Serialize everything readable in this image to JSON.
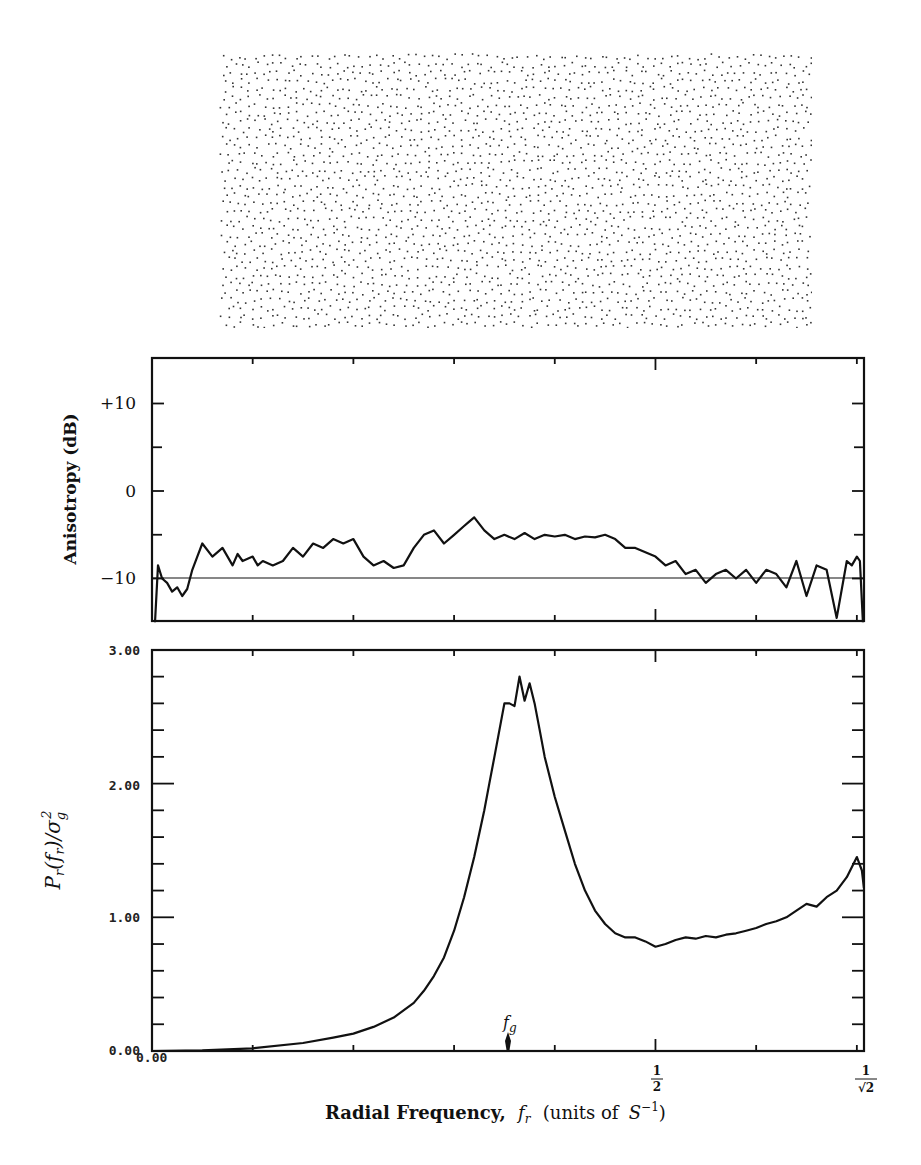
{
  "figure": {
    "stipple_pattern": {
      "description": "blue-noise dot pattern",
      "rows": 34,
      "cols": 74,
      "dot_color": "#333333"
    }
  },
  "chart_data": [
    {
      "type": "line",
      "title": "",
      "ylabel": "Anisotropy (dB)",
      "xlabel": "",
      "ylim": [
        -15,
        15
      ],
      "xlim": [
        0,
        0.7071
      ],
      "yticks": [
        {
          "value": 10,
          "label": "+10"
        },
        {
          "value": 0,
          "label": "0"
        },
        {
          "value": -10,
          "label": "-10"
        }
      ],
      "reference_line": {
        "y": -10
      },
      "grid": false,
      "series": [
        {
          "name": "Anisotropy",
          "x": [
            0.003,
            0.006,
            0.01,
            0.015,
            0.02,
            0.025,
            0.03,
            0.035,
            0.04,
            0.045,
            0.05,
            0.06,
            0.07,
            0.08,
            0.085,
            0.09,
            0.1,
            0.105,
            0.11,
            0.12,
            0.13,
            0.14,
            0.15,
            0.16,
            0.17,
            0.18,
            0.19,
            0.2,
            0.21,
            0.22,
            0.23,
            0.24,
            0.25,
            0.26,
            0.27,
            0.28,
            0.29,
            0.3,
            0.31,
            0.315,
            0.32,
            0.33,
            0.34,
            0.35,
            0.36,
            0.37,
            0.38,
            0.39,
            0.4,
            0.41,
            0.42,
            0.43,
            0.44,
            0.45,
            0.46,
            0.47,
            0.48,
            0.49,
            0.5,
            0.51,
            0.52,
            0.53,
            0.54,
            0.55,
            0.56,
            0.57,
            0.58,
            0.59,
            0.6,
            0.61,
            0.62,
            0.63,
            0.64,
            0.65,
            0.66,
            0.67,
            0.68,
            0.69,
            0.695,
            0.7,
            0.703,
            0.706
          ],
          "y": [
            -15,
            -8.5,
            -10,
            -10.5,
            -11.5,
            -11,
            -12,
            -11.2,
            -9,
            -7.5,
            -6,
            -7.5,
            -6.5,
            -8.5,
            -7.2,
            -8,
            -7.5,
            -8.5,
            -8,
            -8.5,
            -8,
            -6.5,
            -7.5,
            -6,
            -6.5,
            -5.5,
            -6,
            -5.5,
            -7.5,
            -8.5,
            -8,
            -8.8,
            -8.5,
            -6.5,
            -5,
            -4.5,
            -6,
            -5,
            -4,
            -3.5,
            -3,
            -4.5,
            -5.5,
            -5,
            -5.5,
            -4.8,
            -5.5,
            -5,
            -5.2,
            -5,
            -5.5,
            -5.2,
            -5.3,
            -5,
            -5.5,
            -6.5,
            -6.5,
            -7,
            -7.5,
            -8.5,
            -8,
            -9.5,
            -9,
            -10.5,
            -9.5,
            -9,
            -10,
            -9,
            -10.5,
            -9,
            -9.5,
            -11,
            -8,
            -12,
            -8.5,
            -9,
            -14.5,
            -8,
            -8.5,
            -7.5,
            -8,
            -15
          ]
        }
      ]
    },
    {
      "type": "line",
      "title": "",
      "ylabel": "P_r(f_r)/σ_g^2",
      "xlabel": "Radial Frequency, f_r (units of S^-1)",
      "ylim": [
        0,
        3
      ],
      "xlim": [
        0,
        0.7071
      ],
      "yticks": [
        {
          "value": 0,
          "label": "0.00"
        },
        {
          "value": 1,
          "label": "1.00"
        },
        {
          "value": 2,
          "label": "2.00"
        },
        {
          "value": 3,
          "label": "3.00"
        }
      ],
      "xticks": [
        {
          "value": 0,
          "label": "0.00"
        },
        {
          "value": 0.5,
          "label": "1/2"
        },
        {
          "value": 0.7071,
          "label": "1/√2"
        }
      ],
      "annotations": [
        {
          "text": "f_g",
          "x": 0.352,
          "marker": "arrow at x-axis"
        }
      ],
      "grid": false,
      "series": [
        {
          "name": "P_r(f_r)/σ_g^2",
          "x": [
            0,
            0.05,
            0.1,
            0.15,
            0.18,
            0.2,
            0.22,
            0.24,
            0.26,
            0.27,
            0.28,
            0.29,
            0.3,
            0.31,
            0.32,
            0.33,
            0.335,
            0.34,
            0.345,
            0.35,
            0.355,
            0.36,
            0.365,
            0.37,
            0.375,
            0.38,
            0.385,
            0.39,
            0.4,
            0.41,
            0.42,
            0.43,
            0.44,
            0.45,
            0.46,
            0.47,
            0.48,
            0.49,
            0.5,
            0.51,
            0.52,
            0.53,
            0.54,
            0.55,
            0.56,
            0.57,
            0.58,
            0.59,
            0.6,
            0.61,
            0.62,
            0.63,
            0.64,
            0.65,
            0.66,
            0.67,
            0.68,
            0.69,
            0.7,
            0.705,
            0.707
          ],
          "y": [
            0,
            0.005,
            0.02,
            0.06,
            0.1,
            0.13,
            0.18,
            0.25,
            0.36,
            0.45,
            0.56,
            0.7,
            0.9,
            1.15,
            1.45,
            1.8,
            2.0,
            2.2,
            2.4,
            2.6,
            2.6,
            2.58,
            2.8,
            2.62,
            2.75,
            2.6,
            2.4,
            2.2,
            1.9,
            1.65,
            1.4,
            1.2,
            1.05,
            0.95,
            0.88,
            0.85,
            0.85,
            0.82,
            0.78,
            0.8,
            0.83,
            0.85,
            0.84,
            0.86,
            0.85,
            0.87,
            0.88,
            0.9,
            0.92,
            0.95,
            0.97,
            1.0,
            1.05,
            1.1,
            1.08,
            1.15,
            1.2,
            1.3,
            1.45,
            1.35,
            1.22
          ]
        }
      ]
    }
  ],
  "labels": {
    "top_ylabel": "Anisotropy (dB)",
    "top_ytick_plus10": "+10",
    "top_ytick_0": "0",
    "top_ytick_minus10": "−10",
    "bottom_ytick_3": "3.00",
    "bottom_ytick_2": "2.00",
    "bottom_ytick_1": "1.00",
    "bottom_ytick_0": "0.00",
    "bottom_xtick_0": "0.00",
    "xtick_half_num": "1",
    "xtick_half_den": "2",
    "xtick_root_num": "1",
    "xtick_root_den": "√2",
    "fg_label_f": "f",
    "fg_label_sub": "g",
    "xlabel_bold": "Radial Frequency,",
    "xlabel_italic": "f",
    "xlabel_sub": "r",
    "xlabel_units": "(units of",
    "xlabel_S": "S",
    "xlabel_exp": "−1",
    "xlabel_close": ")",
    "bottom_ylabel_P": "P",
    "bottom_ylabel_r": "r",
    "bottom_ylabel_mid": "(f",
    "bottom_ylabel_r2": "r",
    "bottom_ylabel_rest": ")/σ",
    "bottom_ylabel_g": "g",
    "bottom_ylabel_2": "2"
  }
}
